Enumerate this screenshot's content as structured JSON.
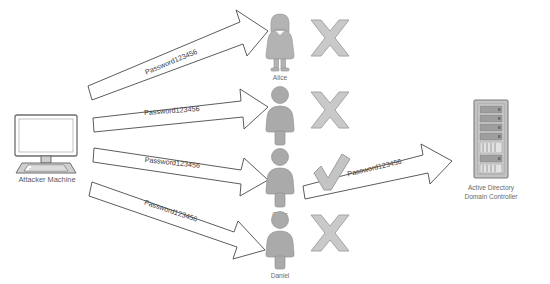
{
  "diagram": {
    "type": "network-attack-diagram",
    "background_color": "#ffffff",
    "line_color": "#4a4a4a",
    "figure_color": "#b3b3b3",
    "fail_mark_color": "#c9c9c9",
    "success_mark_color": "#c4c4c4"
  },
  "attacker": {
    "label": "Attacker Machine",
    "icon": "desktop-computer-icon"
  },
  "server": {
    "label_line1": "Active Directory",
    "label_line2": "Domain Controller",
    "icon": "server-rack-icon"
  },
  "password": "Password123456",
  "users": [
    {
      "name": "Alice",
      "icon": "female-user-icon",
      "result": "fail",
      "result_icon": "x-mark-icon",
      "attempt_label": "Password123456"
    },
    {
      "name": "Bob",
      "icon": "male-user-icon",
      "result": "fail",
      "result_icon": "x-mark-icon",
      "attempt_label": "Password123456"
    },
    {
      "name": "Chris",
      "icon": "male-user-icon",
      "result": "success",
      "result_icon": "check-mark-icon",
      "attempt_label": "Password123456"
    },
    {
      "name": "Daniel",
      "icon": "male-user-icon",
      "result": "fail",
      "result_icon": "x-mark-icon",
      "attempt_label": "Password123456"
    }
  ],
  "authenticated_flow": {
    "from": "Chris",
    "to": "Active Directory Domain Controller",
    "label": "Password123456"
  }
}
